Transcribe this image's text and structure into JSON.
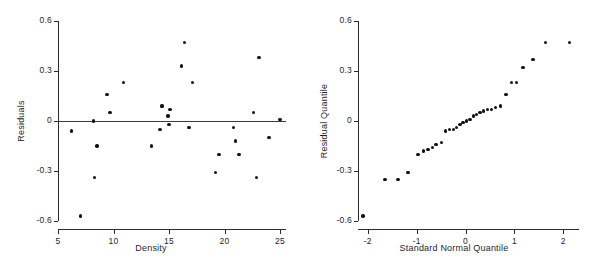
{
  "figure": {
    "width": 605,
    "height": 275,
    "background": "#ffffff",
    "point_color": "#121212",
    "axis_color": "#2b2b2b"
  },
  "chart_data": [
    {
      "type": "scatter",
      "name": "residuals-vs-density",
      "title": "",
      "xlabel": "Density",
      "ylabel": "Residuals",
      "xlim": [
        5,
        25
      ],
      "ylim": [
        -0.6,
        0.6
      ],
      "xticks": [
        5,
        10,
        15,
        20,
        25
      ],
      "yticks": [
        0.6,
        0.3,
        0,
        -0.3,
        -0.6
      ],
      "xticklabels": [
        "5",
        "10",
        "15",
        "20",
        "25"
      ],
      "yticklabels": [
        "0.6",
        "0.3",
        "0",
        "-0.3",
        "-0.6"
      ],
      "grid": false,
      "legend": "none",
      "reference_line": {
        "orientation": "horizontal",
        "y": 0
      },
      "x": [
        6.2,
        7.0,
        8.2,
        8.3,
        8.5,
        9.4,
        9.7,
        10.9,
        13.4,
        14.2,
        14.3,
        14.4,
        14.9,
        15.0,
        15.1,
        16.1,
        16.4,
        16.8,
        17.1,
        19.2,
        19.5,
        20.8,
        21.0,
        21.3,
        22.6,
        22.9,
        23.1,
        24.0,
        25.0
      ],
      "y": [
        -0.06,
        -0.57,
        0.0,
        -0.34,
        -0.15,
        0.16,
        0.05,
        0.23,
        -0.15,
        -0.05,
        0.09,
        0.09,
        0.03,
        -0.02,
        0.07,
        0.33,
        0.47,
        -0.04,
        0.23,
        -0.31,
        -0.2,
        -0.04,
        -0.12,
        -0.2,
        0.05,
        -0.34,
        0.38,
        -0.1,
        0.01
      ]
    },
    {
      "type": "scatter",
      "name": "normal-qq-plot",
      "title": "",
      "xlabel": "Standard Normal Quantile",
      "ylabel": "Residual Quantile",
      "xlim": [
        -2.2,
        2.2
      ],
      "ylim": [
        -0.6,
        0.6
      ],
      "xticks": [
        -2,
        -1,
        0,
        1,
        2
      ],
      "yticks": [
        0.6,
        0.3,
        0,
        -0.3,
        -0.6
      ],
      "xticklabels": [
        "-2",
        "-1",
        "0",
        "1",
        "2"
      ],
      "yticklabels": [
        "0.6",
        "0.3",
        "0",
        "-0.3",
        "-0.6"
      ],
      "grid": false,
      "legend": "none",
      "x": [
        -2.1,
        -1.65,
        -1.38,
        -1.18,
        -0.97,
        -0.86,
        -0.77,
        -0.68,
        -0.6,
        -0.49,
        -0.41,
        -0.33,
        -0.25,
        -0.18,
        -0.11,
        -0.05,
        0.02,
        0.09,
        0.16,
        0.23,
        0.3,
        0.37,
        0.45,
        0.53,
        0.62,
        0.72,
        0.83,
        0.94,
        1.04,
        1.18,
        1.38,
        1.64,
        2.13
      ],
      "y": [
        -0.57,
        -0.35,
        -0.35,
        -0.31,
        -0.2,
        -0.18,
        -0.17,
        -0.16,
        -0.14,
        -0.13,
        -0.06,
        -0.05,
        -0.05,
        -0.04,
        -0.02,
        -0.01,
        0.0,
        0.01,
        0.03,
        0.04,
        0.05,
        0.06,
        0.07,
        0.07,
        0.08,
        0.09,
        0.16,
        0.23,
        0.23,
        0.32,
        0.37,
        0.47,
        0.47
      ]
    }
  ]
}
